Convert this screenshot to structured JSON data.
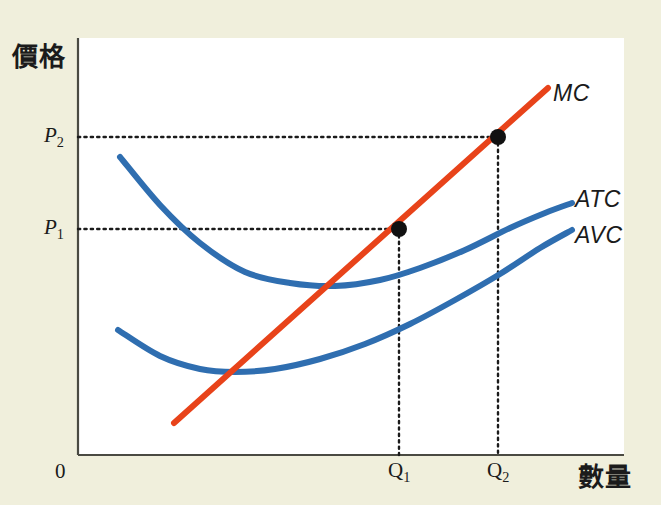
{
  "figure": {
    "background_color": "#f0efdc",
    "plot_background_color": "#ffffff"
  },
  "axes": {
    "y_label": "價格",
    "x_label": "數量",
    "origin_label": "0",
    "axis_color": "#4a4a42"
  },
  "ticks": {
    "p2": "P",
    "p2_sub": "2",
    "p1": "P",
    "p1_sub": "1",
    "q1": "Q",
    "q1_sub": "1",
    "q2": "Q",
    "q2_sub": "2"
  },
  "curves": {
    "mc_label": "MC",
    "atc_label": "ATC",
    "avc_label": "AVC",
    "mc_color": "#e8431a",
    "atc_color": "#2f6eb0",
    "avc_color": "#2f6eb0",
    "marker_color": "#111111",
    "guide_color": "#1b1b1b"
  },
  "chart_data": {
    "type": "line",
    "title": "",
    "xlabel": "數量",
    "ylabel": "價格",
    "grid": false,
    "legend": "inline-right-labels",
    "xlim": [
      0,
      546
    ],
    "ylim": [
      0,
      417
    ],
    "annotations": [
      {
        "label": "P",
        "sub": "2",
        "type": "y-tick",
        "y_px": 137
      },
      {
        "label": "P",
        "sub": "1",
        "type": "y-tick",
        "y_px": 229
      },
      {
        "label": "Q",
        "sub": "1",
        "type": "x-tick",
        "x_px": 399
      },
      {
        "label": "Q",
        "sub": "2",
        "type": "x-tick",
        "x_px": 498
      },
      {
        "label": "0",
        "type": "origin",
        "x_px": 78,
        "y_px": 455
      }
    ],
    "series": [
      {
        "name": "MC",
        "color": "#e8431a",
        "shape": "upward-sloping straight line",
        "points": [
          [
            174,
            423
          ],
          [
            548,
            88
          ]
        ]
      },
      {
        "name": "ATC",
        "color": "#2f6eb0",
        "shape": "U-shaped, minimum near Q just left of Q1",
        "points": [
          [
            120,
            157
          ],
          [
            160,
            205
          ],
          [
            200,
            243
          ],
          [
            245,
            272
          ],
          [
            290,
            283
          ],
          [
            335,
            286
          ],
          [
            380,
            280
          ],
          [
            420,
            268
          ],
          [
            465,
            250
          ],
          [
            510,
            228
          ],
          [
            545,
            213
          ],
          [
            572,
            203
          ]
        ]
      },
      {
        "name": "AVC",
        "color": "#2f6eb0",
        "shape": "U-shaped, minimum where MC crosses it",
        "points": [
          [
            118,
            330
          ],
          [
            160,
            356
          ],
          [
            200,
            369
          ],
          [
            235,
            372
          ],
          [
            275,
            369
          ],
          [
            320,
            359
          ],
          [
            365,
            344
          ],
          [
            410,
            324
          ],
          [
            455,
            300
          ],
          [
            500,
            274
          ],
          [
            540,
            248
          ],
          [
            572,
            230
          ]
        ]
      }
    ],
    "intersections": [
      {
        "name": "MC crosses AVC minimum",
        "x_px": 235,
        "y_px": 371,
        "marked": false
      },
      {
        "name": "MC at P1/Q1",
        "x_px": 399,
        "y_px": 229,
        "marked": true
      },
      {
        "name": "MC at P2/Q2",
        "x_px": 498,
        "y_px": 137,
        "marked": true
      }
    ],
    "guides": [
      {
        "from": [
          78,
          137
        ],
        "to": [
          498,
          137
        ],
        "style": "dotted",
        "axis": "horizontal",
        "label": "P2"
      },
      {
        "from": [
          78,
          229
        ],
        "to": [
          399,
          229
        ],
        "style": "dotted",
        "axis": "horizontal",
        "label": "P1"
      },
      {
        "from": [
          399,
          229
        ],
        "to": [
          399,
          455
        ],
        "style": "dotted",
        "axis": "vertical",
        "label": "Q1"
      },
      {
        "from": [
          498,
          137
        ],
        "to": [
          498,
          455
        ],
        "style": "dotted",
        "axis": "vertical",
        "label": "Q2"
      }
    ]
  }
}
